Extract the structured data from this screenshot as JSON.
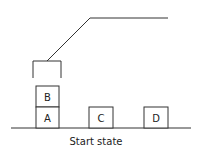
{
  "diagram": {
    "caption": "Start state",
    "line_color": "#333333",
    "blocks": [
      {
        "label": "B",
        "x": 36,
        "y": 86,
        "w": 23,
        "h": 21
      },
      {
        "label": "A",
        "x": 36,
        "y": 107,
        "w": 23,
        "h": 21
      },
      {
        "label": "C",
        "x": 89,
        "y": 107,
        "w": 24,
        "h": 21
      },
      {
        "label": "D",
        "x": 144,
        "y": 107,
        "w": 24,
        "h": 21
      }
    ]
  }
}
